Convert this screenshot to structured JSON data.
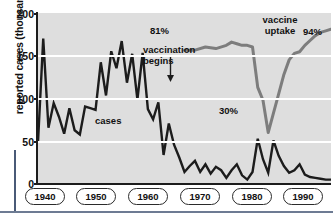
{
  "chart_data": {
    "type": "line",
    "title": "",
    "xlabel": "",
    "ylabel": "reported cases (thousands)",
    "xlim": [
      1940,
      1996
    ],
    "ylim": [
      0,
      200
    ],
    "grid": true,
    "legend_position": "none",
    "y_ticks": [
      "0",
      "50",
      "100",
      "150",
      "200"
    ],
    "y_tick_values": [
      0,
      50,
      100,
      150,
      200
    ],
    "x_ticks": [
      "1940",
      "1950",
      "1960",
      "1970",
      "1980",
      "1990"
    ],
    "x_tick_values": [
      1940,
      1950,
      1960,
      1970,
      1980,
      1990
    ],
    "series": [
      {
        "name": "cases",
        "unit": "thousands of reported cases",
        "x": [
          1940,
          1941,
          1942,
          1943,
          1944,
          1945,
          1946,
          1947,
          1948,
          1949,
          1950,
          1951,
          1952,
          1953,
          1954,
          1955,
          1956,
          1957,
          1958,
          1959,
          1960,
          1961,
          1962,
          1963,
          1964,
          1965,
          1966,
          1967,
          1968,
          1969,
          1970,
          1971,
          1972,
          1973,
          1974,
          1975,
          1976,
          1977,
          1978,
          1979,
          1980,
          1981,
          1982,
          1983,
          1984,
          1985,
          1986,
          1987,
          1988,
          1989,
          1990,
          1991,
          1992,
          1993,
          1994,
          1995,
          1996
        ],
        "values": [
          48,
          170,
          65,
          94,
          78,
          58,
          88,
          62,
          57,
          90,
          88,
          86,
          142,
          103,
          155,
          135,
          167,
          118,
          152,
          98,
          153,
          87,
          75,
          95,
          33,
          70,
          45,
          30,
          13,
          20,
          26,
          13,
          22,
          11,
          19,
          15,
          6,
          15,
          22,
          9,
          4,
          13,
          52,
          28,
          12,
          50,
          32,
          20,
          12,
          15,
          22,
          10,
          7,
          6,
          5,
          4,
          4
        ]
      },
      {
        "name": "vaccine uptake",
        "unit": "percent",
        "x": [
          1968,
          1970,
          1972,
          1974,
          1976,
          1977,
          1978,
          1979,
          1980,
          1981,
          1982,
          1983,
          1984,
          1985,
          1986,
          1987,
          1988,
          1989,
          1990,
          1991,
          1992,
          1993,
          1994,
          1995,
          1996
        ],
        "values": [
          81,
          81,
          83,
          82,
          84,
          86,
          85,
          84,
          84,
          83,
          58,
          50,
          30,
          42,
          54,
          66,
          75,
          79,
          80,
          84,
          87,
          90,
          92,
          93,
          94
        ]
      }
    ],
    "annotations": [
      {
        "name": "vaccination-begins",
        "text": "vaccination begins",
        "x": 1963,
        "y": 100,
        "arrow": "down"
      },
      {
        "name": "cases",
        "text": "cases",
        "x": 1955,
        "y": 72
      },
      {
        "name": "uptake-start",
        "text": "81%",
        "x": 1968,
        "y": 81
      },
      {
        "name": "uptake-min",
        "text": "30%",
        "x": 1984,
        "y": 30
      },
      {
        "name": "uptake-label",
        "text": "vaccine uptake",
        "x": 1990,
        "y": 90
      },
      {
        "name": "uptake-end",
        "text": "94%",
        "x": 1996,
        "y": 94
      }
    ]
  },
  "axes": {
    "y_title": "reported cases (thousands)",
    "y_ticks": [
      "200",
      "150",
      "100",
      "50",
      "0"
    ],
    "x_ticks": [
      "1940",
      "1950",
      "1960",
      "1970",
      "1980",
      "1990"
    ]
  },
  "annotations": {
    "vaccination_begins": "vaccination\nbegins",
    "vaccination_begins_line1": "vaccination",
    "vaccination_begins_line2": "begins",
    "cases": "cases",
    "pct_81": "81%",
    "pct_30": "30%",
    "vaccine_uptake_line1": "vaccine",
    "vaccine_uptake_line2": "uptake",
    "pct_94": "94%"
  },
  "colors": {
    "plot_background": "#dedede",
    "gridline": "#ffffff",
    "cases_line": "#1c1c1c",
    "uptake_line": "#7d7d7d",
    "axis": "#1c1c1c",
    "text": "#111111",
    "rule": "#6d7b93"
  }
}
